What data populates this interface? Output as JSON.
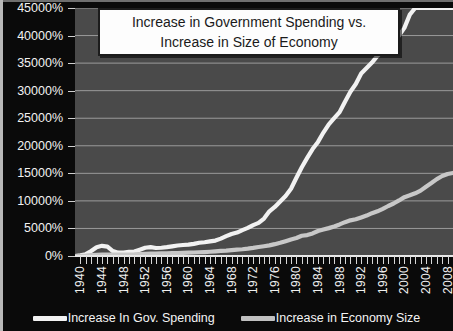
{
  "chart_data": {
    "type": "line",
    "title": "Increase in Government Spending vs. Increase in Size of Economy",
    "title_lines": [
      "Increase in Government Spending vs.",
      "Increase in Size of Economy"
    ],
    "xlabel": "",
    "ylabel": "",
    "ylim": [
      0,
      45000
    ],
    "ytick_labels": [
      "45000%",
      "40000%",
      "35000%",
      "30000%",
      "25000%",
      "20000%",
      "15000%",
      "10000%",
      "5000%",
      "0%"
    ],
    "ytick_values": [
      45000,
      40000,
      35000,
      30000,
      25000,
      20000,
      15000,
      10000,
      5000,
      0
    ],
    "xlim": [
      1939,
      2009
    ],
    "xtick_labels": [
      "1940",
      "1944",
      "1948",
      "1952",
      "1956",
      "1960",
      "1964",
      "1968",
      "1972",
      "1976",
      "1980",
      "1984",
      "1988",
      "1992",
      "1996",
      "2000",
      "2004",
      "2008"
    ],
    "xtick_values": [
      1940,
      1944,
      1948,
      1952,
      1956,
      1960,
      1964,
      1968,
      1972,
      1976,
      1980,
      1984,
      1988,
      1992,
      1996,
      2000,
      2004,
      2008
    ],
    "grid": true,
    "legend_position": "bottom",
    "x": [
      1939,
      1940,
      1941,
      1942,
      1943,
      1944,
      1945,
      1946,
      1947,
      1948,
      1949,
      1950,
      1951,
      1952,
      1953,
      1954,
      1955,
      1956,
      1957,
      1958,
      1959,
      1960,
      1961,
      1962,
      1963,
      1964,
      1965,
      1966,
      1967,
      1968,
      1969,
      1970,
      1971,
      1972,
      1973,
      1974,
      1975,
      1976,
      1977,
      1978,
      1979,
      1980,
      1981,
      1982,
      1983,
      1984,
      1985,
      1986,
      1987,
      1988,
      1989,
      1990,
      1991,
      1992,
      1993,
      1994,
      1995,
      1996,
      1997,
      1998,
      1999,
      2000,
      2001,
      2002,
      2003,
      2004,
      2005,
      2006,
      2007,
      2008,
      2009
    ],
    "series": [
      {
        "name": "Increase In Gov. Spending",
        "color": "#f2f2f2",
        "values": [
          0,
          120,
          330,
          900,
          1600,
          1850,
          1700,
          900,
          600,
          620,
          760,
          800,
          1150,
          1500,
          1600,
          1450,
          1500,
          1600,
          1750,
          1900,
          2000,
          2050,
          2200,
          2400,
          2500,
          2650,
          2800,
          3150,
          3600,
          4000,
          4250,
          4700,
          5100,
          5600,
          6000,
          6800,
          8100,
          8900,
          9900,
          10900,
          12200,
          14200,
          16100,
          17800,
          19400,
          20700,
          22400,
          23900,
          25000,
          26100,
          28000,
          29800,
          31200,
          33100,
          34100,
          35100,
          36300,
          37200,
          38100,
          38900,
          40000,
          41400,
          43800,
          47200,
          50500,
          53400,
          56500,
          59300,
          62000,
          66000,
          82000
        ],
        "values_note": "values scaled to chart max 45000%; final 2009 spike truncated at top"
      },
      {
        "name": "Increase in Economy Size",
        "color": "#c8c8c8",
        "values": [
          0,
          60,
          170,
          400,
          620,
          700,
          700,
          650,
          680,
          740,
          720,
          800,
          950,
          1050,
          1120,
          1130,
          1260,
          1340,
          1420,
          1450,
          1570,
          1640,
          1700,
          1830,
          1930,
          2080,
          2250,
          2470,
          2610,
          2870,
          3130,
          3300,
          3580,
          3930,
          4400,
          4770,
          5180,
          5770,
          6430,
          7250,
          8090,
          8800,
          9860,
          10200,
          11000,
          12200,
          12900,
          13600,
          14400,
          15400,
          16500,
          17400,
          17900,
          18800,
          19700,
          20900,
          21800,
          23000,
          24400,
          25600,
          27100,
          28700,
          29600,
          30600,
          31900,
          33800,
          35600,
          37500,
          39000,
          40000,
          40500
        ],
        "values_note": "secondary series; rendered at ~1/2.7 of spending scale reaching ~15000% in 2009"
      }
    ]
  },
  "legend": {
    "items": [
      {
        "label": "Increase In Gov. Spending",
        "color": "#f2f2f2"
      },
      {
        "label": "Increase in Economy Size",
        "color": "#c0c0c0"
      }
    ]
  },
  "colors": {
    "plot_background": "#4a4a4a",
    "page_background": "#0a0a0a",
    "gridline": "#9b9b9b",
    "axis": "#e8e8e8",
    "text": "#f2f2f2",
    "title_background": "#fdfdfd",
    "title_text": "#1a1a1a"
  }
}
